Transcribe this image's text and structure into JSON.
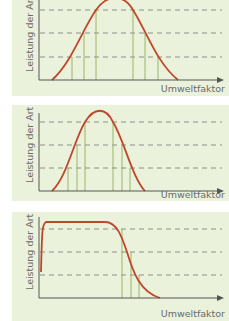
{
  "colors": {
    "background": "#eaf2dc",
    "curve": "#c0462a",
    "axis": "#555555",
    "dashed": "#777777",
    "verticals": "#8fae5a"
  },
  "panels": [
    {
      "ylabel": "Leistung der Art",
      "xlabel": "Umweltfaktor",
      "shape": "wide bell curve"
    },
    {
      "ylabel": "Leistung der Art",
      "xlabel": "Umweltfaktor",
      "shape": "narrow bell curve"
    },
    {
      "ylabel": "Leistung der Art",
      "xlabel": "Umweltfaktor",
      "shape": "plateau then steep decline"
    }
  ]
}
